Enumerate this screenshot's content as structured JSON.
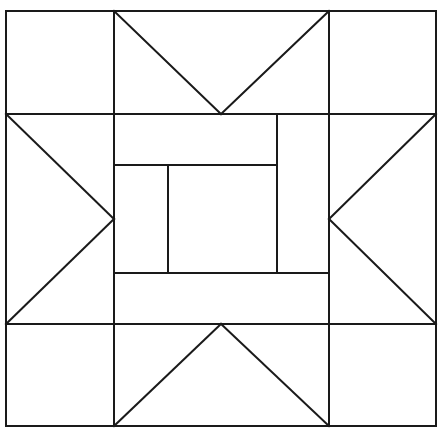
{
  "figure": {
    "title": "Quilt Block Line Diagram",
    "kind": "line-drawing",
    "canvas": {
      "width": 442,
      "height": 436,
      "background_color": "#ffffff"
    },
    "style": {
      "line_color": "#1a1a1a",
      "line_width": 2,
      "fill_color": "#ffffff"
    },
    "bounds": {
      "left": 6,
      "top": 11,
      "right": 436,
      "bottom": 426
    },
    "grid": {
      "vertical_guides": [
        6,
        114,
        221,
        277,
        329,
        436
      ],
      "horizontal_guides": [
        11,
        114,
        165,
        219,
        273,
        324,
        426
      ],
      "center_x": 221,
      "center_y": 219
    },
    "chart_data": {
      "type": "line-diagram",
      "title": "Quilt Block Line Diagram",
      "xlabel": "",
      "ylabel": "",
      "xlim": [
        0,
        442
      ],
      "ylim": [
        0,
        436
      ],
      "grid": false,
      "legend": "none",
      "segments": [
        {
          "name": "outer-border-top",
          "x1": 6,
          "y1": 11,
          "x2": 436,
          "y2": 11
        },
        {
          "name": "outer-border-bottom",
          "x1": 6,
          "y1": 426,
          "x2": 436,
          "y2": 426
        },
        {
          "name": "outer-border-left",
          "x1": 6,
          "y1": 11,
          "x2": 6,
          "y2": 426
        },
        {
          "name": "outer-border-right",
          "x1": 436,
          "y1": 11,
          "x2": 436,
          "y2": 426
        },
        {
          "name": "grid-horizontal-upper",
          "x1": 6,
          "y1": 114,
          "x2": 436,
          "y2": 114
        },
        {
          "name": "grid-horizontal-lower",
          "x1": 6,
          "y1": 324,
          "x2": 436,
          "y2": 324
        },
        {
          "name": "grid-vertical-left",
          "x1": 114,
          "y1": 11,
          "x2": 114,
          "y2": 426
        },
        {
          "name": "grid-vertical-right",
          "x1": 329,
          "y1": 11,
          "x2": 329,
          "y2": 426
        },
        {
          "name": "star-point-top-left-diagonal",
          "x1": 114,
          "y1": 11,
          "x2": 221,
          "y2": 114
        },
        {
          "name": "star-point-top-right-diagonal",
          "x1": 329,
          "y1": 11,
          "x2": 221,
          "y2": 114
        },
        {
          "name": "star-point-bottom-left-diagonal",
          "x1": 114,
          "y1": 426,
          "x2": 221,
          "y2": 324
        },
        {
          "name": "star-point-bottom-right-diagonal",
          "x1": 329,
          "y1": 426,
          "x2": 221,
          "y2": 324
        },
        {
          "name": "star-point-left-upper-diagonal",
          "x1": 6,
          "y1": 114,
          "x2": 114,
          "y2": 219
        },
        {
          "name": "star-point-left-lower-diagonal",
          "x1": 6,
          "y1": 324,
          "x2": 114,
          "y2": 219
        },
        {
          "name": "star-point-right-upper-diagonal",
          "x1": 436,
          "y1": 114,
          "x2": 329,
          "y2": 219
        },
        {
          "name": "star-point-right-lower-diagonal",
          "x1": 436,
          "y1": 324,
          "x2": 329,
          "y2": 219
        },
        {
          "name": "center-unit-upper-rail",
          "x1": 114,
          "y1": 165,
          "x2": 277,
          "y2": 165
        },
        {
          "name": "center-unit-lower-rail",
          "x1": 114,
          "y1": 273,
          "x2": 329,
          "y2": 273
        },
        {
          "name": "center-unit-right-stile",
          "x1": 277,
          "y1": 114,
          "x2": 277,
          "y2": 273
        },
        {
          "name": "center-unit-inner-stile",
          "x1": 168,
          "y1": 165,
          "x2": 168,
          "y2": 273
        }
      ],
      "regions": [
        {
          "name": "corner-top-left",
          "role": "plain-square"
        },
        {
          "name": "corner-top-right",
          "role": "plain-square"
        },
        {
          "name": "corner-bottom-left",
          "role": "plain-square"
        },
        {
          "name": "corner-bottom-right",
          "role": "plain-square"
        },
        {
          "name": "star-point-top",
          "role": "flying-geese"
        },
        {
          "name": "star-point-bottom",
          "role": "flying-geese"
        },
        {
          "name": "star-point-left",
          "role": "flying-geese"
        },
        {
          "name": "star-point-right",
          "role": "flying-geese"
        },
        {
          "name": "center-medallion",
          "role": "pieced-center"
        }
      ]
    }
  }
}
